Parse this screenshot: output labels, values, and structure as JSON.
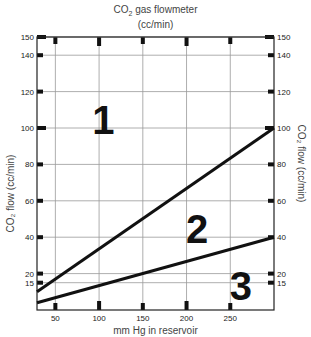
{
  "chart_data": {
    "type": "line",
    "subtitle": "(cc/min)",
    "xlabel": "mm Hg in reservoir",
    "ylabel": "CO₂ flow (cc/min)",
    "ylabel_right": "CO₂ flow (cc/min)",
    "xlim": [
      29,
      300
    ],
    "ylim": [
      0,
      150
    ],
    "x_ticks": [
      50,
      100,
      150,
      200,
      250
    ],
    "y_ticks": [
      15,
      20,
      40,
      60,
      80,
      100,
      120,
      140,
      150
    ],
    "grid": true,
    "series": [
      {
        "name": "upper boundary",
        "x": [
          29,
          300
        ],
        "values": [
          10,
          100
        ]
      },
      {
        "name": "lower boundary",
        "x": [
          29,
          300
        ],
        "values": [
          4,
          40
        ]
      }
    ],
    "annotations": [
      {
        "text": "1",
        "x": 105,
        "y": 105
      },
      {
        "text": "2",
        "x": 212,
        "y": 45
      },
      {
        "text": "3",
        "x": 262,
        "y": 14
      }
    ]
  },
  "labels": {
    "title_line1": "CO",
    "title_sub": "2",
    "title_line1_rest": " gas flowmeter",
    "title_line2": "(cc/min)",
    "xlabel": "mm Hg in reservoir",
    "ylabel": "CO₂ flow (cc/min)"
  }
}
